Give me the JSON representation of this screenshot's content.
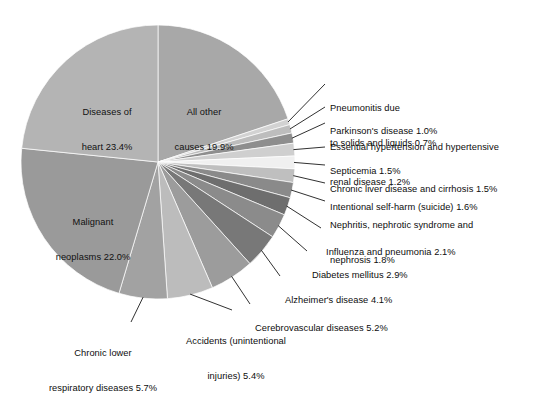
{
  "chart_data": {
    "type": "pie",
    "title": "",
    "subtitle": "",
    "xlabel": "",
    "ylabel": "",
    "legend_position": "callout-labels",
    "grid": false,
    "units": "percent",
    "total": 100.0,
    "start_angle_deg": -90,
    "direction": "clockwise",
    "categories": [
      "All other causes",
      "Pneumonitis due to solids and liquids",
      "Parkinson's disease",
      "Essential hypertension and hypertensive renal disease",
      "Septicemia",
      "Chronic liver disease and cirrhosis",
      "Intentional self-harm (suicide)",
      "Nephritis, nephrotic syndrome and nephrosis",
      "Influenza and pneumonia",
      "Diabetes mellitus",
      "Alzheimer's disease",
      "Cerebrovascular diseases",
      "Accidents (unintentional injuries)",
      "Chronic lower respiratory diseases",
      "Malignant neoplasms",
      "Diseases of heart"
    ],
    "values": [
      19.9,
      0.7,
      1.0,
      1.2,
      1.5,
      1.5,
      1.6,
      1.8,
      2.1,
      2.9,
      4.1,
      5.2,
      5.4,
      5.7,
      22.0,
      23.4
    ],
    "colors": [
      "#a8a8a8",
      "#d2d2d2",
      "#bdbdbd",
      "#8e8e8e",
      "#cfcfcf",
      "#f0f0f0",
      "#bfbfbf",
      "#8a8a8a",
      "#6e6e6e",
      "#8b8b8b",
      "#787878",
      "#9c9c9c",
      "#bcbcbc",
      "#a2a2a2",
      "#9a9a9a",
      "#b4b4b4"
    ],
    "slices": [
      {
        "label": "All other",
        "label2": "causes 19.9%",
        "value": 19.9,
        "color": "#a8a8a8",
        "placement": "inside"
      },
      {
        "label": "Pneumonitis due",
        "label2": "to solids and liquids 0.7%",
        "value": 0.7,
        "color": "#d2d2d2",
        "placement": "callout"
      },
      {
        "label": "Parkinson's disease 1.0%",
        "label2": "",
        "value": 1.0,
        "color": "#bdbdbd",
        "placement": "callout"
      },
      {
        "label": "Essential hypertension and hypertensive",
        "label2": "renal disease 1.2%",
        "value": 1.2,
        "color": "#8e8e8e",
        "placement": "callout"
      },
      {
        "label": "Septicemia 1.5%",
        "label2": "",
        "value": 1.5,
        "color": "#cfcfcf",
        "placement": "callout"
      },
      {
        "label": "Chronic liver disease and cirrhosis 1.5%",
        "label2": "",
        "value": 1.5,
        "color": "#f0f0f0",
        "placement": "callout"
      },
      {
        "label": "Intentional self-harm (suicide) 1.6%",
        "label2": "",
        "value": 1.6,
        "color": "#bfbfbf",
        "placement": "callout"
      },
      {
        "label": "Nephritis, nephrotic syndrome and",
        "label2": "nephrosis 1.8%",
        "value": 1.8,
        "color": "#8a8a8a",
        "placement": "callout"
      },
      {
        "label": "Influenza and pneumonia 2.1%",
        "label2": "",
        "value": 2.1,
        "color": "#6e6e6e",
        "placement": "callout"
      },
      {
        "label": "Diabetes mellitus 2.9%",
        "label2": "",
        "value": 2.9,
        "color": "#8b8b8b",
        "placement": "callout"
      },
      {
        "label": "Alzheimer's disease 4.1%",
        "label2": "",
        "value": 4.1,
        "color": "#787878",
        "placement": "callout"
      },
      {
        "label": "Cerebrovascular diseases 5.2%",
        "label2": "",
        "value": 5.2,
        "color": "#9c9c9c",
        "placement": "callout"
      },
      {
        "label": "Accidents (unintentional",
        "label2": "injuries) 5.4%",
        "value": 5.4,
        "color": "#bcbcbc",
        "placement": "callout"
      },
      {
        "label": "Chronic lower",
        "label2": "respiratory diseases 5.7%",
        "value": 5.7,
        "color": "#a2a2a2",
        "placement": "callout"
      },
      {
        "label": "Malignant",
        "label2": "neoplasms 22.0%",
        "value": 22.0,
        "color": "#9a9a9a",
        "placement": "inside"
      },
      {
        "label": "Diseases of",
        "label2": "heart 23.4%",
        "value": 23.4,
        "color": "#b4b4b4",
        "placement": "inside"
      }
    ]
  },
  "labels": {
    "diseases_of_heart": {
      "l1": "Diseases of",
      "l2": "heart 23.4%"
    },
    "all_other_causes": {
      "l1": "All other",
      "l2": "causes 19.9%"
    },
    "malignant_neoplasms": {
      "l1": "Malignant",
      "l2": "neoplasms 22.0%"
    },
    "pneumonitis": {
      "l1": "Pneumonitis due",
      "l2": "to solids and liquids 0.7%"
    },
    "parkinsons": {
      "l1": "Parkinson's disease 1.0%",
      "l2": ""
    },
    "essential_hypertension": {
      "l1": "Essential hypertension and hypertensive",
      "l2": "renal disease 1.2%"
    },
    "septicemia": {
      "l1": "Septicemia 1.5%",
      "l2": ""
    },
    "chronic_liver": {
      "l1": "Chronic liver disease and cirrhosis 1.5%",
      "l2": ""
    },
    "self_harm": {
      "l1": "Intentional self-harm (suicide) 1.6%",
      "l2": ""
    },
    "nephritis": {
      "l1": "Nephritis, nephrotic syndrome and",
      "l2": "nephrosis 1.8%"
    },
    "influenza": {
      "l1": "Influenza and pneumonia 2.1%",
      "l2": ""
    },
    "diabetes": {
      "l1": "Diabetes mellitus 2.9%",
      "l2": ""
    },
    "alzheimers": {
      "l1": "Alzheimer's disease 4.1%",
      "l2": ""
    },
    "cerebrovascular": {
      "l1": "Cerebrovascular diseases 5.2%",
      "l2": ""
    },
    "accidents": {
      "l1": "Accidents (unintentional",
      "l2": "injuries) 5.4%"
    },
    "chronic_lower_resp": {
      "l1": "Chronic lower",
      "l2": "respiratory diseases 5.7%"
    }
  },
  "geometry": {
    "cx": 158,
    "cy": 162,
    "r": 137,
    "background": "#ffffff",
    "leader_color": "#1a1a1a"
  }
}
